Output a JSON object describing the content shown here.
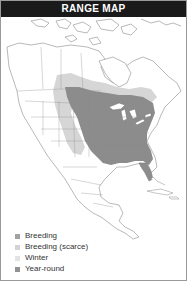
{
  "title": "RANGE MAP",
  "colors": {
    "title_bg": "#1a1a1a",
    "title_text": "#ffffff",
    "land": "#ffffff",
    "borders": "#8a8a8a",
    "breeding": "#9c9c9c",
    "breeding_scarce": "#d6d6d6",
    "winter": "#e6e6e6",
    "year_round": "#8c8c8c"
  },
  "legend": {
    "items": [
      {
        "label": "Breeding",
        "color": "#a2a2a2"
      },
      {
        "label": "Breeding (scarce)",
        "color": "#d4d4d4"
      },
      {
        "label": "Winter",
        "color": "#e2e2e2"
      },
      {
        "label": "Year-round",
        "color": "#929292"
      }
    ]
  },
  "map": {
    "region": "North America",
    "ranges_shown": [
      "Breeding",
      "Year-round"
    ]
  }
}
